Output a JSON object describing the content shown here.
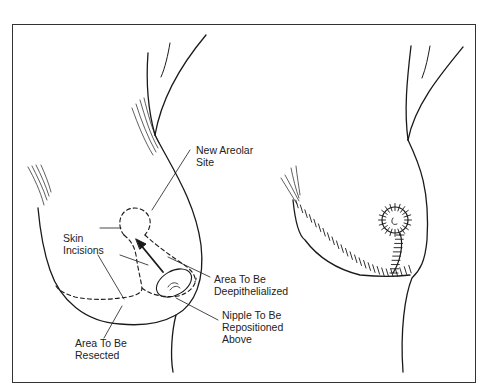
{
  "figure": {
    "left_panel": {
      "description": "Breast before reduction, showing planned incisions",
      "labels": {
        "new_areolar_site": "New Areolar\nSite",
        "skin_incisions": "Skin\nIncisions",
        "area_deepithelialized": "Area To Be\nDeepithelialized",
        "nipple_repositioned": "Nipple To Be\nRepositioned\nAbove",
        "area_resected": "Area To Be\nResected"
      }
    },
    "right_panel": {
      "description": "Breast after reduction with sutured inverted-T closure and repositioned areola"
    },
    "colors": {
      "line": "#1a1a1a",
      "background": "#ffffff",
      "frame": "#333333"
    }
  }
}
